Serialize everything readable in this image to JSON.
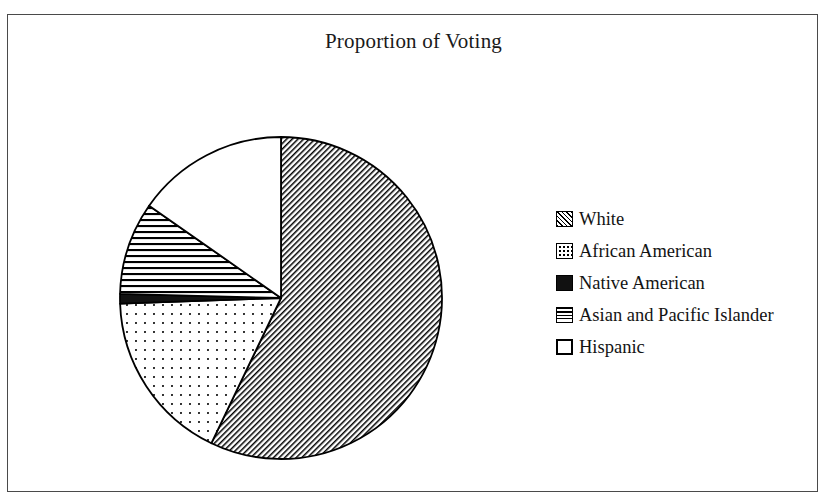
{
  "chart_data": {
    "type": "pie",
    "title": "Proportion of Voting",
    "xlabel": "",
    "ylabel": "",
    "legend_position": "right",
    "grid": false,
    "categories": [
      "White",
      "African American",
      "Native American",
      "Asian and Pacific Islander",
      "Hispanic"
    ],
    "values": [
      57.1,
      17.3,
      1.0,
      9.3,
      15.3
    ],
    "slices": [
      {
        "label": "White",
        "value": 57.1,
        "start_angle": 0,
        "end_angle": 205.6,
        "pattern": "diagonal-hatch",
        "color": "#000000"
      },
      {
        "label": "African American",
        "value": 17.3,
        "start_angle": 205.6,
        "end_angle": 268.0,
        "pattern": "dots",
        "color": "#000000"
      },
      {
        "label": "Native American",
        "value": 1.0,
        "start_angle": 268.0,
        "end_angle": 271.5,
        "pattern": "solid",
        "color": "#111111"
      },
      {
        "label": "Asian and Pacific Islander",
        "value": 9.3,
        "start_angle": 271.5,
        "end_angle": 305.0,
        "pattern": "horizontal-lines",
        "color": "#000000"
      },
      {
        "label": "Hispanic",
        "value": 15.3,
        "start_angle": 305.0,
        "end_angle": 360.0,
        "pattern": "empty",
        "color": "#ffffff"
      }
    ]
  },
  "legend": {
    "items": [
      {
        "label": "White",
        "swatch": "hatch-swatch-icon"
      },
      {
        "label": "African American",
        "swatch": "dotted-swatch-icon"
      },
      {
        "label": "Native American",
        "swatch": "solid-swatch-icon"
      },
      {
        "label": "Asian and Pacific Islander",
        "swatch": "horizontal-lines-swatch-icon"
      },
      {
        "label": "Hispanic",
        "swatch": "empty-swatch-icon"
      }
    ]
  },
  "geometry": {
    "center_x": 273,
    "center_y": 283,
    "radius": 161
  }
}
